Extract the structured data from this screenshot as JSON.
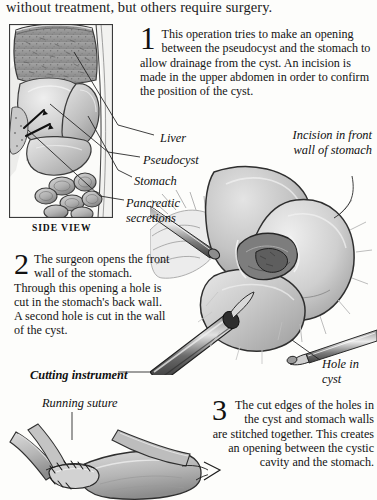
{
  "page": {
    "header_text": "without treatment, but others require surgery."
  },
  "steps": [
    {
      "number": "1",
      "text": "This operation tries to make an opening between the pseudocyst and the stomach to allow drainage from the cyst. An incision is made in the upper abdomen in order to confirm the position of the cyst."
    },
    {
      "number": "2",
      "text": "The surgeon opens the front wall of the stomach. Through this opening a hole is cut in the stomach's back wall. A second hole is cut in the wall of the cyst."
    },
    {
      "number": "3",
      "text": "The cut edges of the holes in the cyst and stomach walls are stitched together. This creates an opening between the cystic cavity and the stomach."
    }
  ],
  "labels": {
    "liver": "Liver",
    "pseudocyst": "Pseudocyst",
    "stomach": "Stomach",
    "pancreatic_secretions": "Pancreatic secretions",
    "incision_front_wall": "Incision in front wall of stomach",
    "cutting_instrument": "Cutting instrument",
    "hole_in_cyst": "Hole in cyst",
    "running_suture": "Running suture",
    "side_view_caption": "SIDE VIEW"
  },
  "colors": {
    "page_background": "#fdfdfb",
    "text": "#141414",
    "organ_light": "#d6d6d6",
    "organ_mid": "#b4b4b4",
    "organ_dark": "#8d8d8d",
    "liver_tissue": "#9a9a9a",
    "instrument_dark": "#4a4a4a",
    "outline": "#2b2b2b"
  }
}
